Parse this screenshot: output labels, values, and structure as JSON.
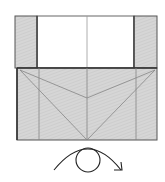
{
  "diagram": {
    "type": "origami-fold-instruction",
    "colors": {
      "paper_back": "#d4d4d4",
      "paper_front": "#ffffff",
      "outline": "#555555",
      "crease": "#8a8a8a",
      "arrow": "#222222"
    },
    "parts": [
      {
        "name": "left-flap",
        "fill": "gray"
      },
      {
        "name": "top-white-area",
        "fill": "white"
      },
      {
        "name": "right-flap",
        "fill": "gray"
      },
      {
        "name": "bottom-panel",
        "fill": "gray",
        "creases": "diagonal V lines meeting at center bottom"
      }
    ],
    "symbol": {
      "name": "turn-over-symbol",
      "description": "circle with curved arrow indicating turn model over"
    }
  }
}
